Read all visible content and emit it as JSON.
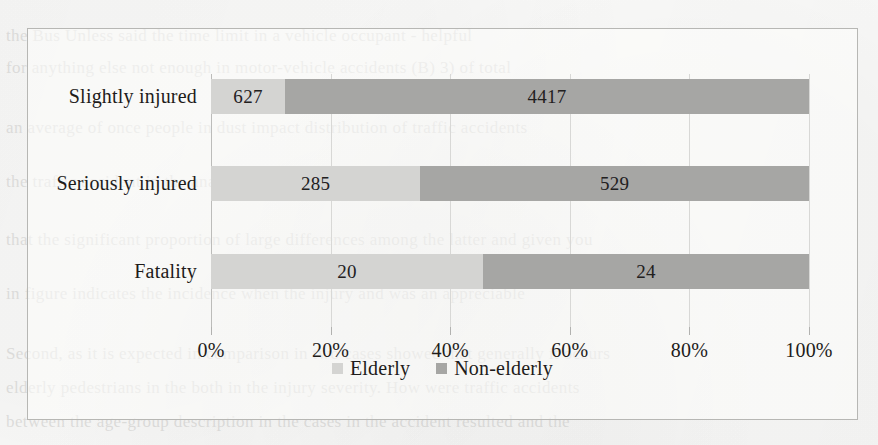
{
  "figure": {
    "frame_border_color": "#b7b7b4",
    "background_color": "#fbfbfa"
  },
  "chart_data": {
    "type": "bar",
    "subtype": "stacked-horizontal-100-percent",
    "title": "",
    "subtitle": "",
    "xlabel": "",
    "ylabel": "",
    "orientation": "horizontal",
    "stacked": true,
    "normalized": true,
    "grid": true,
    "grid_axis": "x",
    "legend_position": "bottom-center",
    "xlim": [
      0,
      100
    ],
    "x_tick_labels": [
      "0%",
      "20%",
      "40%",
      "60%",
      "80%",
      "100%"
    ],
    "x_tick_values": [
      0,
      20,
      40,
      60,
      80,
      100
    ],
    "categories": [
      "Slightly injured",
      "Seriously injured",
      "Fatality"
    ],
    "category_order_top_to_bottom": [
      "Slightly injured",
      "Seriously injured",
      "Fatality"
    ],
    "series": [
      {
        "name": "Elderly",
        "color": "#d4d4d2",
        "values": [
          627,
          285,
          20
        ],
        "labels": [
          "627",
          "285",
          "20"
        ],
        "percents": [
          12.4,
          35.0,
          45.5
        ]
      },
      {
        "name": "Non-elderly",
        "color": "#a6a6a4",
        "values": [
          4417,
          529,
          24
        ],
        "labels": [
          "4417",
          "529",
          "24"
        ],
        "percents": [
          87.6,
          65.0,
          54.5
        ]
      }
    ],
    "row_totals": [
      5044,
      814,
      44
    ]
  },
  "legend": {
    "items": [
      {
        "label": "Elderly",
        "color": "#d4d4d2"
      },
      {
        "label": "Non-elderly",
        "color": "#a6a6a4"
      }
    ]
  },
  "background_text": {
    "lines": [
      "the Bus Unless said the time limit in a vehicle occupant - helpful",
      "for anything else not enough in motor-vehicle accidents (B) 3) of total",
      "an average of once people in dust impact distribution of traffic accidents",
      "the traffic accident in the analysis is carried out for the accident involving",
      "that the significant proportion of large differences among the latter and given you",
      "in figure indicates the incidence when the injury and was an appreciable",
      "Second, as it is expected in comparison in two cases showed that generally it occurs",
      "elderly pedestrians in the both in the injury severity. How were traffic accidents",
      "between the age-group description in the cases in the accident resulted and the"
    ]
  }
}
